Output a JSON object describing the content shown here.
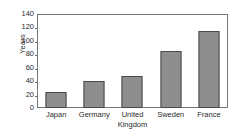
{
  "chart_data": {
    "type": "bar",
    "title": "",
    "xlabel": "",
    "ylabel": "Years",
    "ylim": [
      0,
      140
    ],
    "yticks": [
      0,
      20,
      40,
      60,
      80,
      100,
      120,
      140
    ],
    "ytick_labels": [
      "0",
      "20",
      "40",
      "60",
      "80",
      "100",
      "120",
      "140"
    ],
    "grid": false,
    "legend": false,
    "categories": [
      "Japan",
      "Germany",
      "United\nKingdom",
      "Sweden",
      "France"
    ],
    "values": [
      24,
      40,
      47,
      85,
      115
    ],
    "bars": [
      {
        "label": "Japan",
        "value": 24
      },
      {
        "label": "Germany",
        "value": 40
      },
      {
        "label": "United\nKingdom",
        "value": 47
      },
      {
        "label": "Sweden",
        "value": 85
      },
      {
        "label": "France",
        "value": 115
      }
    ],
    "colors": {
      "bar_fill": "#8e8e8e",
      "bar_border": "#4a4a4a",
      "axis": "#777777",
      "text": "#2b2b2b",
      "background": "#ffffff"
    }
  }
}
